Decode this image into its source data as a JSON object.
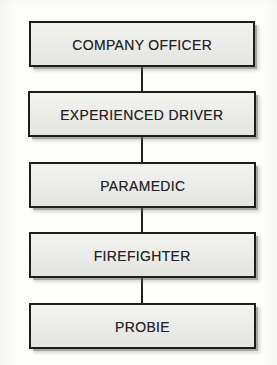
{
  "diagram": {
    "type": "vertical-hierarchy-flowchart",
    "orientation": "top-to-bottom",
    "background_color": "#fdfdfb",
    "node_fill_color": "#ececea",
    "node_border_color": "#1d1d1d",
    "connector_color": "#222222",
    "text_color": "#242424",
    "nodes": [
      {
        "id": "company-officer",
        "label": "COMPANY OFFICER",
        "rank": 1,
        "x": 29,
        "y": 21,
        "width": 226,
        "height": 46
      },
      {
        "id": "experienced-driver",
        "label": "EXPERIENCED DRIVER",
        "rank": 2,
        "x": 28,
        "y": 91,
        "width": 228,
        "height": 46
      },
      {
        "id": "paramedic",
        "label": "PARAMEDIC",
        "rank": 3,
        "x": 29,
        "y": 162,
        "width": 227,
        "height": 46
      },
      {
        "id": "firefighter",
        "label": "FIREFIGHTER",
        "rank": 4,
        "x": 29,
        "y": 232,
        "width": 227,
        "height": 46
      },
      {
        "id": "probie",
        "label": "PROBIE",
        "rank": 5,
        "x": 29,
        "y": 303,
        "width": 227,
        "height": 46
      }
    ],
    "connectors": [
      {
        "id": "connector-1",
        "from": "company-officer",
        "to": "experienced-driver",
        "x": 141,
        "y": 67,
        "length": 24
      },
      {
        "id": "connector-2",
        "from": "experienced-driver",
        "to": "paramedic",
        "x": 141,
        "y": 137,
        "length": 25
      },
      {
        "id": "connector-3",
        "from": "paramedic",
        "to": "firefighter",
        "x": 141,
        "y": 208,
        "length": 24
      },
      {
        "id": "connector-4",
        "from": "firefighter",
        "to": "probie",
        "x": 141,
        "y": 278,
        "length": 25
      }
    ]
  }
}
